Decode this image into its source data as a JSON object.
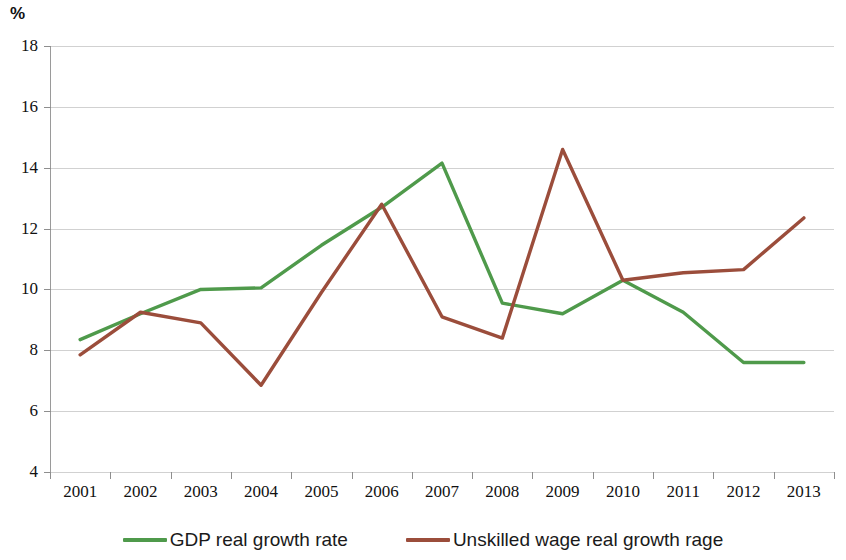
{
  "chart_data": {
    "type": "line",
    "title": "",
    "subtitle": "",
    "xlabel": "",
    "ylabel": "%",
    "categories": [
      "2001",
      "2002",
      "2003",
      "2004",
      "2005",
      "2006",
      "2007",
      "2008",
      "2009",
      "2010",
      "2011",
      "2012",
      "2013"
    ],
    "ylim": [
      4,
      18
    ],
    "ytick_step": 2,
    "yticks": [
      "4",
      "6",
      "8",
      "10",
      "12",
      "14",
      "16",
      "18"
    ],
    "grid": "horizontal",
    "legend_position": "bottom",
    "series": [
      {
        "name": "GDP real growth rate",
        "color": "#4f9a4b",
        "values": [
          8.35,
          9.2,
          10.0,
          10.05,
          11.45,
          12.7,
          14.15,
          9.55,
          9.2,
          10.3,
          9.25,
          7.6,
          7.6
        ]
      },
      {
        "name": "Unskilled wage real growth rage",
        "color": "#9b4d3b",
        "values": [
          7.85,
          9.25,
          8.9,
          6.85,
          9.9,
          12.8,
          9.1,
          8.4,
          14.6,
          10.3,
          10.55,
          10.65,
          12.35
        ]
      }
    ]
  },
  "axis": {
    "unit_label": "%"
  },
  "legend": {
    "items": [
      {
        "label": "GDP real growth rate",
        "color": "#4f9a4b"
      },
      {
        "label": "Unskilled wage real growth rage",
        "color": "#9b4d3b"
      }
    ]
  }
}
